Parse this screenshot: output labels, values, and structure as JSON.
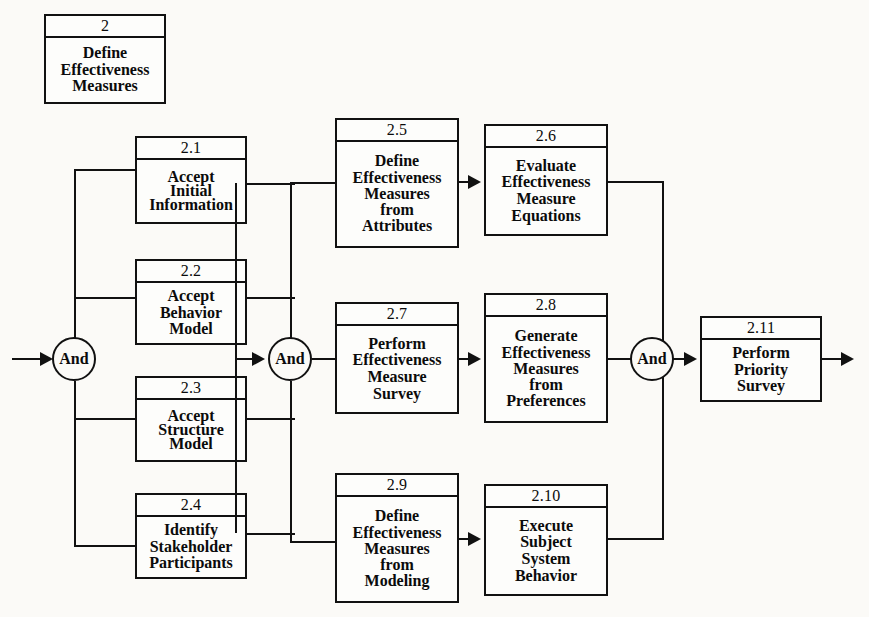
{
  "diagram": {
    "title_box": {
      "number": "2",
      "lines": [
        "Define",
        "Effectiveness",
        "Measures"
      ]
    },
    "junctions": [
      {
        "name": "and-gate-1",
        "label": "And"
      },
      {
        "name": "and-gate-2",
        "label": "And"
      },
      {
        "name": "and-gate-3",
        "label": "And"
      }
    ],
    "boxes": [
      {
        "number": "2.1",
        "lines": [
          "Accept",
          "Initial",
          "Information"
        ]
      },
      {
        "number": "2.2",
        "lines": [
          "Accept",
          "Behavior",
          "Model"
        ]
      },
      {
        "number": "2.3",
        "lines": [
          "Accept",
          "Structure",
          "Model"
        ]
      },
      {
        "number": "2.4",
        "lines": [
          "Identify",
          "Stakeholder",
          "Participants"
        ]
      },
      {
        "number": "2.5",
        "lines": [
          "Define",
          "Effectiveness",
          "Measures",
          "from",
          "Attributes"
        ]
      },
      {
        "number": "2.6",
        "lines": [
          "Evaluate",
          "Effectiveness",
          "Measure",
          "Equations"
        ]
      },
      {
        "number": "2.7",
        "lines": [
          "Perform",
          "Effectiveness",
          "Measure",
          "Survey"
        ]
      },
      {
        "number": "2.8",
        "lines": [
          "Generate",
          "Effectiveness",
          "Measures",
          "from",
          "Preferences"
        ]
      },
      {
        "number": "2.9",
        "lines": [
          "Define",
          "Effectiveness",
          "Measures",
          "from",
          "Modeling"
        ]
      },
      {
        "number": "2.10",
        "lines": [
          "Execute",
          "Subject",
          "System",
          "Behavior"
        ]
      },
      {
        "number": "2.11",
        "lines": [
          "Perform",
          "Priority",
          "Survey"
        ]
      }
    ],
    "colors": {
      "line": "#111111",
      "background": "#fbfaf7",
      "text": "#0b0b0b"
    }
  }
}
